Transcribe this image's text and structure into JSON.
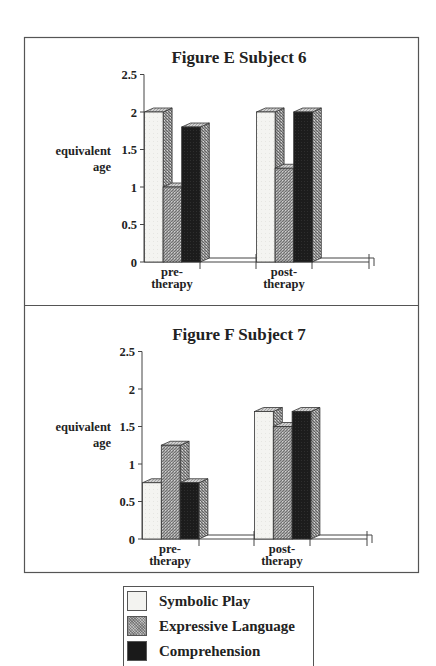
{
  "chart_data": [
    {
      "type": "bar",
      "style": "3d-grouped-bar",
      "title": "Figure E  Subject 6",
      "xlabel": "",
      "ylabel": "equivalent age",
      "ylabel_lines": [
        "equivalent",
        "age"
      ],
      "ylim": [
        0,
        2.5
      ],
      "yticks": [
        "0",
        "0.5",
        "1",
        "1.5",
        "2",
        "2.5"
      ],
      "grid": false,
      "categories": [
        "pre-therapy",
        "post-therapy"
      ],
      "category_label_lines": [
        [
          "pre-",
          "therapy"
        ],
        [
          "post-",
          "therapy"
        ]
      ],
      "series": [
        {
          "name": "Symbolic Play",
          "values": [
            2.0,
            2.0
          ]
        },
        {
          "name": "Expressive Language",
          "values": [
            1.0,
            1.25
          ]
        },
        {
          "name": "Comprehension",
          "values": [
            1.8,
            2.0
          ]
        }
      ],
      "legend_position": "bottom (shared)"
    },
    {
      "type": "bar",
      "style": "3d-grouped-bar",
      "title": "Figure F  Subject 7",
      "xlabel": "",
      "ylabel": "equivalent age",
      "ylabel_lines": [
        "equivalent",
        "age"
      ],
      "ylim": [
        0,
        2.5
      ],
      "yticks": [
        "0",
        "0.5",
        "1",
        "1.5",
        "2",
        "2.5"
      ],
      "grid": false,
      "categories": [
        "pre-therapy",
        "post-therapy"
      ],
      "category_label_lines": [
        [
          "pre-",
          "therapy"
        ],
        [
          "post-",
          "therapy"
        ]
      ],
      "series": [
        {
          "name": "Symbolic Play",
          "values": [
            0.75,
            1.7
          ]
        },
        {
          "name": "Expressive Language",
          "values": [
            1.25,
            1.5
          ]
        },
        {
          "name": "Comprehension",
          "values": [
            0.75,
            1.7
          ]
        }
      ],
      "legend_position": "bottom (shared)"
    }
  ],
  "legend": {
    "items": [
      {
        "label": "Symbolic Play",
        "fill": "light",
        "color": "#f3f3f0"
      },
      {
        "label": "Expressive Language",
        "fill": "hatched-gray",
        "color": "#9a9a9a"
      },
      {
        "label": "Comprehension",
        "fill": "dark",
        "color": "#1a1a1a"
      }
    ]
  },
  "colors": {
    "border": "#555555",
    "text": "#222222",
    "light_bar": "#f3f3f0",
    "mid_bar": "#9a9a9a",
    "dark_bar": "#1a1a1a",
    "side_face": "#8c8c8c"
  }
}
